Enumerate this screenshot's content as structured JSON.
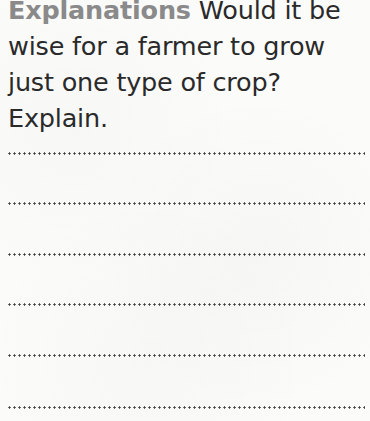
{
  "question": {
    "label": "Explanations",
    "text": "Would it be wise for a farmer to grow just one type of crop? Explain."
  },
  "answer_lines": [
    {
      "top": 152
    },
    {
      "top": 202
    },
    {
      "top": 253
    },
    {
      "top": 303
    },
    {
      "top": 354
    },
    {
      "top": 406
    }
  ],
  "colors": {
    "label": "#8a8a8a",
    "text": "#2a2a2a",
    "dots": "#3d3d3d",
    "paper": "#fbfbfa"
  }
}
